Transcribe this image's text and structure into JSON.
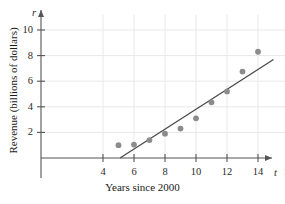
{
  "chart_data": {
    "type": "scatter",
    "title": "",
    "xlabel": "Years since 2000",
    "ylabel": "Revenue (billions of dollars)",
    "x_variable": "t",
    "y_variable": "r",
    "xlim": [
      0,
      17.2
    ],
    "ylim": [
      0,
      11.2
    ],
    "xticks": [
      4,
      6,
      8,
      10,
      12,
      14,
      16
    ],
    "yticks": [
      2,
      4,
      6,
      8,
      10
    ],
    "xtick_labels": [
      "4",
      "6",
      "8",
      "10",
      "12",
      "14",
      "16"
    ],
    "ytick_labels": [
      "2",
      "4",
      "6",
      "8",
      "10"
    ],
    "grid": true,
    "grid_color": "#e8e8e8",
    "legend": "none",
    "point_color": "#8c8c8c",
    "line_color": "#4a4a4a",
    "axis_color": "#555555",
    "x": [
      5,
      6,
      7,
      8,
      9,
      10,
      11,
      12,
      13,
      14
    ],
    "y": [
      1.0,
      1.05,
      1.4,
      1.9,
      2.3,
      3.1,
      4.35,
      5.2,
      6.75,
      8.3
    ],
    "points": [
      {
        "t": 5,
        "r": 1.0
      },
      {
        "t": 6,
        "r": 1.05
      },
      {
        "t": 7,
        "r": 1.4
      },
      {
        "t": 8,
        "r": 1.9
      },
      {
        "t": 9,
        "r": 2.3
      },
      {
        "t": 10,
        "r": 3.1
      },
      {
        "t": 11,
        "r": 4.35
      },
      {
        "t": 12,
        "r": 5.2
      },
      {
        "t": 13,
        "r": 6.75
      },
      {
        "t": 14,
        "r": 8.3
      }
    ],
    "trend_line": {
      "x_start": 5.1,
      "y_start": 0.0,
      "x_end": 15.0,
      "y_end": 7.7
    }
  }
}
